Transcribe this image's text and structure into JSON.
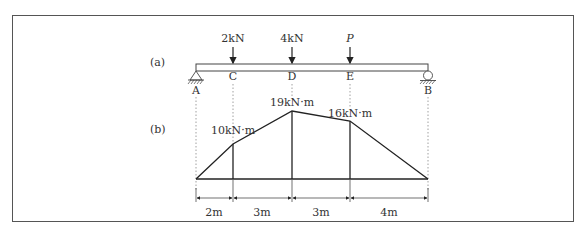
{
  "figure": {
    "part_a_label": "(a)",
    "part_b_label": "(b)",
    "loads": [
      {
        "label": "2kN",
        "point": "C"
      },
      {
        "label": "4kN",
        "point": "D"
      },
      {
        "label": "P",
        "point": "E"
      }
    ],
    "points": {
      "A": "A",
      "C": "C",
      "D": "D",
      "E": "E",
      "B": "B"
    },
    "supports": {
      "A": "pin",
      "B": "roller"
    },
    "moments": [
      {
        "label": "10kN·m",
        "point": "C",
        "value": 10
      },
      {
        "label": "19kN·m",
        "point": "D",
        "value": 19
      },
      {
        "label": "16kN·m",
        "point": "E",
        "value": 16
      }
    ],
    "dimensions": [
      {
        "label": "2m",
        "length": 2
      },
      {
        "label": "3m",
        "length": 3
      },
      {
        "label": "3m",
        "length": 3
      },
      {
        "label": "4m",
        "length": 4
      }
    ]
  }
}
